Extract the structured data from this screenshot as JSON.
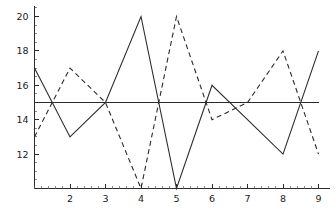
{
  "chart_data": {
    "type": "line",
    "title": "",
    "subtitle": "",
    "xlabel": "",
    "ylabel": "",
    "x": [
      1,
      2,
      3,
      4,
      5,
      6,
      7,
      8,
      9
    ],
    "series": [
      {
        "name": "solid-series",
        "style": "solid",
        "color": "#2b2b2b",
        "values": [
          17,
          13,
          15,
          20,
          10,
          16,
          14,
          12,
          18
        ]
      },
      {
        "name": "dashed-series",
        "style": "dashed",
        "color": "#2b2b2b",
        "values": [
          13,
          17,
          15,
          10,
          20,
          14,
          15,
          18,
          12
        ]
      },
      {
        "name": "reference-line",
        "style": "solid",
        "color": "#2b2b2b",
        "values": [
          15,
          15,
          15,
          15,
          15,
          15,
          15,
          15,
          15
        ]
      }
    ],
    "xlim": [
      1,
      9
    ],
    "ylim": [
      10,
      20.6
    ],
    "xticks": [
      2,
      3,
      4,
      5,
      6,
      7,
      8,
      9
    ],
    "xtick_labels": [
      "2",
      "3",
      "4",
      "5",
      "6",
      "7",
      "8",
      "9"
    ],
    "yticks": [
      12,
      14,
      16,
      18,
      20
    ],
    "ytick_labels": [
      "12",
      "14",
      "16",
      "18",
      "20"
    ],
    "x_minor_step": 0.2,
    "y_minor_step": 0.5,
    "grid": false,
    "legend": "none"
  },
  "axes": {
    "x_axis_name": "x-axis",
    "y_axis_name": "y-axis"
  }
}
